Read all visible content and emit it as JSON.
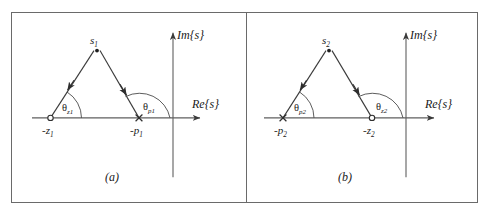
{
  "figure": {
    "type": "complex-plane-diagram-pair",
    "panels": [
      {
        "caption": "(a)",
        "axis_imag_label": "Im{s}",
        "axis_real_label": "Re{s}",
        "apex_label": "s",
        "apex_sub": "1",
        "left_marker": "zero-open-circle",
        "left_label": "-z",
        "left_sub": "1",
        "left_angle": "θ",
        "left_angle_sub": "z1",
        "right_marker": "pole-cross",
        "right_label": "-p",
        "right_sub": "1",
        "right_angle": "θ",
        "right_angle_sub": "p1"
      },
      {
        "caption": "(b)",
        "axis_imag_label": "Im{s}",
        "axis_real_label": "Re{s}",
        "apex_label": "s",
        "apex_sub": "2",
        "left_marker": "pole-cross",
        "left_label": "-p",
        "left_sub": "2",
        "left_angle": "θ",
        "left_angle_sub": "p2",
        "right_marker": "zero-open-circle",
        "right_label": "-z",
        "right_sub": "2",
        "right_angle": "θ",
        "right_angle_sub": "z2"
      }
    ],
    "colors": {
      "line": "#3a3a3a",
      "frame": "#6a6a6a",
      "text": "#1a1a1a"
    }
  }
}
